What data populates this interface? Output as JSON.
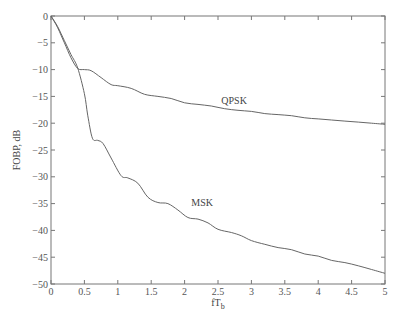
{
  "chart_data": {
    "type": "line",
    "title": "",
    "xlabel": "fT",
    "xlabel_sub": "b",
    "ylabel": "FOBP, dB",
    "xlim": [
      0,
      5
    ],
    "ylim": [
      -50,
      0
    ],
    "grid": false,
    "legend": "inline labels",
    "x_ticks": [
      0,
      0.5,
      1,
      1.5,
      2,
      2.5,
      3,
      3.5,
      4,
      4.5,
      5
    ],
    "x_tick_labels": [
      "0",
      "0.5",
      "1",
      "1.5",
      "2",
      "2.5",
      "3",
      "3.5",
      "4",
      "4.5",
      "5"
    ],
    "y_ticks": [
      0,
      -5,
      -10,
      -15,
      -20,
      -25,
      -30,
      -35,
      -40,
      -45,
      -50
    ],
    "y_tick_labels": [
      "0",
      "-5",
      "-10",
      "-15",
      "-20",
      "-25",
      "-30",
      "-35",
      "-40",
      "-45",
      "-50"
    ],
    "series": [
      {
        "name": "QPSK",
        "label_pos": [
          2.55,
          -16.5
        ],
        "x": [
          0,
          0.1,
          0.2,
          0.3,
          0.4,
          0.5,
          0.6,
          0.75,
          0.9,
          1.0,
          1.2,
          1.4,
          1.6,
          1.8,
          2.0,
          2.2,
          2.4,
          2.6,
          2.8,
          3.0,
          3.2,
          3.4,
          3.6,
          3.8,
          4.0,
          4.2,
          4.4,
          4.6,
          4.8,
          5.0
        ],
        "values": [
          0,
          -2.2,
          -5.0,
          -7.8,
          -9.8,
          -10.0,
          -10.2,
          -11.5,
          -12.8,
          -13.0,
          -13.5,
          -14.6,
          -15.0,
          -15.4,
          -16.2,
          -16.5,
          -16.8,
          -17.3,
          -17.6,
          -17.8,
          -18.2,
          -18.4,
          -18.6,
          -19.0,
          -19.2,
          -19.4,
          -19.6,
          -19.8,
          -20.0,
          -20.2
        ]
      },
      {
        "name": "MSK",
        "label_pos": [
          2.1,
          -35.5
        ],
        "x": [
          0,
          0.1,
          0.2,
          0.3,
          0.4,
          0.5,
          0.55,
          0.62,
          0.7,
          0.78,
          0.9,
          1.05,
          1.15,
          1.3,
          1.45,
          1.6,
          1.75,
          1.9,
          2.05,
          2.2,
          2.35,
          2.5,
          2.7,
          2.85,
          3.0,
          3.2,
          3.4,
          3.6,
          3.8,
          4.0,
          4.2,
          4.4,
          4.6,
          4.8,
          5.0
        ],
        "values": [
          0,
          -2.0,
          -4.6,
          -7.2,
          -9.7,
          -14.5,
          -18.5,
          -22.8,
          -23.2,
          -23.8,
          -26.5,
          -29.8,
          -30.2,
          -31.2,
          -33.8,
          -34.8,
          -35.0,
          -36.2,
          -37.6,
          -37.9,
          -38.6,
          -39.8,
          -40.4,
          -41.0,
          -41.9,
          -42.6,
          -43.2,
          -43.6,
          -44.4,
          -44.8,
          -45.6,
          -46.0,
          -46.6,
          -47.3,
          -48.0
        ]
      }
    ]
  }
}
